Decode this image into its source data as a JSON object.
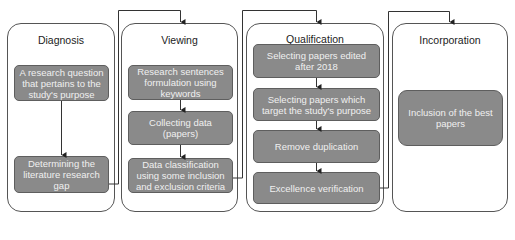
{
  "diagram": {
    "stages": [
      {
        "title": "Diagnosis",
        "steps": [
          "A research question that pertains to the study's purpose",
          "Determining the literature research gap"
        ]
      },
      {
        "title": "Viewing",
        "steps": [
          "Research sentences formulation using keywords",
          "Collecting data (papers)",
          "Data classification using some inclusion and exclusion criteria"
        ]
      },
      {
        "title": "Qualification",
        "steps": [
          "Selecting papers edited after 2018",
          "Selecting papers which target the study's purpose",
          "Remove duplication",
          "Excellence verification"
        ]
      },
      {
        "title": "Incorporation",
        "steps": [
          "Inclusion of the best papers"
        ]
      }
    ],
    "colors": {
      "step_fill": "#8a8a8a",
      "step_text": "#f0f0f0",
      "line": "#333333"
    }
  }
}
